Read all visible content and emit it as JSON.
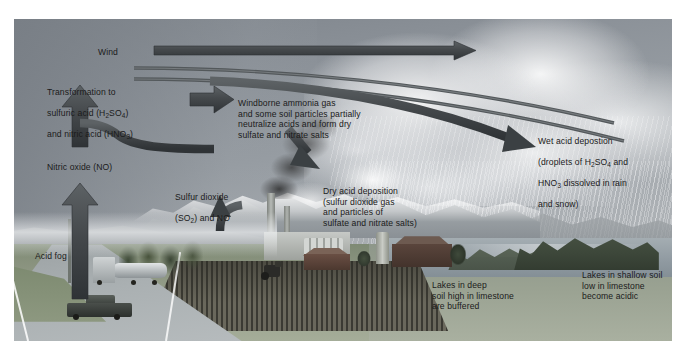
{
  "figure": {
    "canvas": {
      "width": 686,
      "height": 358
    },
    "scene": {
      "left": 14,
      "top": 19,
      "width": 658,
      "height": 322
    }
  },
  "colors": {
    "arrow": "#4a4f52",
    "arrow_dark": "#3b4043",
    "text": "#1b1b1b",
    "sky_top": "#7d838a",
    "sky_bottom": "#b3b7ba",
    "ground": "#8b9480",
    "field": "#3b3a33",
    "water": "#919ba2",
    "forest": "#3c4639",
    "cloud": "#f6f7f8"
  },
  "labels": {
    "wind": "Wind",
    "transformation": "Transformation to\nsulfuric acid (H₂SO₄)\nand nitric acid (HNO₃)",
    "windborne": "Windborne ammonia gas\nand some soil particles partially\nneutralize acids and form dry\nsulfate and nitrate salts",
    "nitric_oxide": "Nitric oxide (NO)",
    "sulfur_dioxide": "Sulfur dioxide\n(SO₂) and NO",
    "dry_deposition": "Dry acid deposition\n(sulfur dioxide gas\nand particles of\nsulfate and nitrate salts)",
    "wet_deposition": "Wet acid depostion\n(droplets of H₂SO₄ and\nHNO₃ dissolved in rain\nand snow)",
    "acid_fog": "Acid fog",
    "lakes_deep": "Lakes in deep\nsoil high in limestone\nare buffered",
    "lakes_shallow": "Lakes in shallow soil\nlow in limestone\nbecome acidic"
  },
  "label_chemistry": {
    "transformation_line1": "Transformation to",
    "transformation_line2_pre": "sulfuric acid (H",
    "transformation_line2_sub": "2",
    "transformation_line2_mid": "SO",
    "transformation_line2_sub2": "4",
    "transformation_line2_post": ")",
    "transformation_line3_pre": "and nitric acid (HNO",
    "transformation_line3_sub": "3",
    "transformation_line3_post": ")",
    "sulfur_line1": "Sulfur dioxide",
    "sulfur_line2_pre": "(SO",
    "sulfur_line2_sub": "2",
    "sulfur_line2_post": ") and NO",
    "wet_line1": "Wet acid depostion",
    "wet_line2_pre": "(droplets of H",
    "wet_line2_sub": "2",
    "wet_line2_mid": "SO",
    "wet_line2_sub2": "4",
    "wet_line2_post": " and",
    "wet_line3_pre": "HNO",
    "wet_line3_sub": "3",
    "wet_line3_post": " dissolved in rain",
    "wet_line4": "and snow)"
  },
  "arrows": [
    {
      "name": "wind-arrow",
      "description": "long straight horizontal arrow pointing right, labelled Wind"
    },
    {
      "name": "wind-stream-line-upper",
      "description": "long curved stream line sweeping right and down"
    },
    {
      "name": "wind-stream-line-lower",
      "description": "second long curved stream line sweeping right and down"
    },
    {
      "name": "transformation-up-arrow",
      "description": "thick vertical arrow pointing up to the transformation label"
    },
    {
      "name": "sulfur-to-transformation-arrow",
      "description": "curved arrow from factory area left and up"
    },
    {
      "name": "nitric-oxide-up-arrow",
      "description": "thick vertical arrow pointing up from the road"
    },
    {
      "name": "sulfur-dioxide-up-arrow",
      "description": "curved arrow rising from the smokestacks"
    },
    {
      "name": "windborne-right-arrow",
      "description": "short thick arrow pointing right into the windborne label"
    },
    {
      "name": "dry-deposition-arrow",
      "description": "short thick arrow pointing down-right to the dry deposition label"
    },
    {
      "name": "wet-deposition-arrow",
      "description": "long curved arrow sweeping right and down into the storm clouds"
    }
  ],
  "scene_elements": [
    {
      "name": "storm-clouds",
      "label": "storm cloud mass over the lake"
    },
    {
      "name": "rain-curtain",
      "label": "rain falling from the storm clouds"
    },
    {
      "name": "snowy-mountains",
      "label": "snow-capped mountain range"
    },
    {
      "name": "factory",
      "label": "industrial plant with smokestacks"
    },
    {
      "name": "smoke-plume",
      "label": "dark smoke plume from the smokestacks"
    },
    {
      "name": "farm-barn",
      "label": "barn and silo"
    },
    {
      "name": "plowed-field",
      "label": "plowed agricultural field with tractor"
    },
    {
      "name": "tanker-truck",
      "label": "tanker truck on the highway"
    },
    {
      "name": "pickup-truck",
      "label": "pickup truck on the highway"
    },
    {
      "name": "highway",
      "label": "highway with lane markings"
    },
    {
      "name": "lake",
      "label": "lake in the valley"
    },
    {
      "name": "forested-hills",
      "label": "forested hills beside the lake"
    }
  ]
}
